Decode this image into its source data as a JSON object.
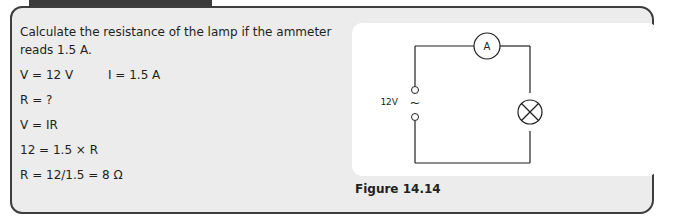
{
  "example": {
    "question_line1": "Calculate the resistance of the lamp if the ammeter",
    "question_line2": "reads 1.5 A.",
    "given_v": "V = 12 V",
    "given_i": "I = 1.5 A",
    "unknown": "R = ?",
    "formula": "V = IR",
    "substitution": "12 = 1.5 × R",
    "answer": "R = 12/1.5 = 8 Ω"
  },
  "figure": {
    "caption": "Figure 14.14",
    "supply_label": "12V",
    "supply_symbol": "~",
    "ammeter_label": "A",
    "components": [
      "ac-supply",
      "ammeter",
      "lamp"
    ]
  }
}
